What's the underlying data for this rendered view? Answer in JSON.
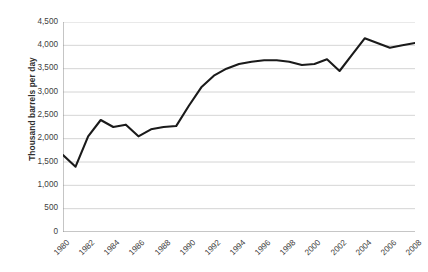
{
  "chart_data": {
    "type": "line",
    "title": "",
    "subtitle": "",
    "xlabel": "",
    "ylabel": "Thousand barrels per day",
    "ylim": [
      0,
      4500
    ],
    "xlim": [
      1980,
      2008
    ],
    "y_ticks": [
      "0",
      "500",
      "1,000",
      "1,500",
      "2,000",
      "2,500",
      "3,000",
      "3,500",
      "4,000",
      "4,500"
    ],
    "y_tick_values": [
      0,
      500,
      1000,
      1500,
      2000,
      2500,
      3000,
      3500,
      4000,
      4500
    ],
    "x_ticks": [
      "1980",
      "1982",
      "1984",
      "1986",
      "1988",
      "1990",
      "1992",
      "1994",
      "1996",
      "1998",
      "2000",
      "2002",
      "2004",
      "2006",
      "2008"
    ],
    "x_tick_values": [
      1980,
      1982,
      1984,
      1986,
      1988,
      1990,
      1992,
      1994,
      1996,
      1998,
      2000,
      2002,
      2004,
      2006,
      2008
    ],
    "grid": "horizontal",
    "legend": "none",
    "line_color": "#1a1a1a",
    "grid_color": "#c9c9c9",
    "axis_color": "#8c8c8c",
    "series": [
      {
        "name": "Thousand barrels per day",
        "x": [
          1980,
          1981,
          1982,
          1983,
          1984,
          1985,
          1986,
          1987,
          1988,
          1989,
          1990,
          1991,
          1992,
          1993,
          1994,
          1995,
          1996,
          1997,
          1998,
          1999,
          2000,
          2001,
          2002,
          2003,
          2004,
          2005,
          2006,
          2007,
          2008
        ],
        "values": [
          1650,
          1400,
          2050,
          2400,
          2250,
          2300,
          2050,
          2200,
          2250,
          2270,
          2700,
          3100,
          3350,
          3500,
          3600,
          3650,
          3680,
          3680,
          3650,
          3580,
          3600,
          3700,
          3450,
          3800,
          4150,
          4050,
          3950,
          4000,
          4050
        ]
      }
    ]
  }
}
